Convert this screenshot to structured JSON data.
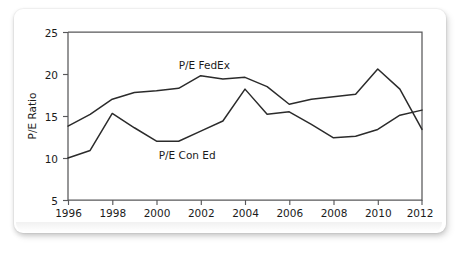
{
  "chart_data": {
    "type": "line",
    "title": "",
    "xlabel": "",
    "ylabel": "P/E Ratio",
    "xlim": [
      1996,
      2012
    ],
    "ylim": [
      5,
      25
    ],
    "grid": false,
    "legend_position": "inline-annotation",
    "x": [
      1996,
      1997,
      1998,
      1999,
      2000,
      2001,
      2002,
      2003,
      2004,
      2005,
      2006,
      2007,
      2008,
      2009,
      2010,
      2011,
      2012
    ],
    "xticks": [
      1996,
      1998,
      2000,
      2002,
      2004,
      2006,
      2008,
      2010,
      2012
    ],
    "xtick_labels": [
      "1996",
      "1998",
      "2000",
      "2002",
      "2004",
      "2006",
      "2008",
      "2010",
      "2012"
    ],
    "yticks": [
      5,
      10,
      15,
      20,
      25
    ],
    "ytick_labels": [
      "5",
      "10",
      "15",
      "20",
      "25"
    ],
    "series": [
      {
        "name": "P/E FedEx",
        "annotation": "P/E FedEx",
        "color": "#2b2b2b",
        "values": [
          13.8,
          15.2,
          17.0,
          17.8,
          18.0,
          18.3,
          19.8,
          19.4,
          19.6,
          18.5,
          16.4,
          17.0,
          17.3,
          17.6,
          20.6,
          18.2,
          13.4
        ]
      },
      {
        "name": "P/E Con Ed",
        "annotation": "P/E Con Ed",
        "color": "#2b2b2b",
        "values": [
          10.0,
          10.9,
          15.3,
          13.6,
          12.0,
          12.0,
          13.2,
          14.4,
          18.2,
          15.2,
          15.5,
          14.0,
          12.4,
          12.6,
          13.4,
          15.1,
          15.7
        ]
      }
    ],
    "annotations": [
      {
        "text": "P/E FedEx",
        "x": 2001.0,
        "y": 20.6
      },
      {
        "text": "P/E Con Ed",
        "x": 2000.1,
        "y": 9.9
      }
    ]
  },
  "axis": {
    "y_title": "P/E Ratio"
  }
}
